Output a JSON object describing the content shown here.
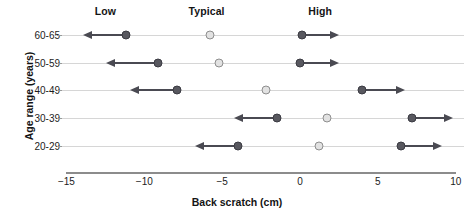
{
  "chart_data": {
    "type": "scatter",
    "title": "",
    "xlabel": "Back scratch (cm)",
    "ylabel": "Age range (years)",
    "xlim": [
      -15,
      10
    ],
    "xticks": [
      -15,
      -10,
      -5,
      0,
      5,
      10
    ],
    "xtick_labels": [
      "−15",
      "−10",
      "−5",
      "0",
      "5",
      "10"
    ],
    "categories": [
      "60-65",
      "50-59",
      "40-49",
      "30-39",
      "20-29"
    ],
    "grid": true,
    "legend": "none",
    "column_headers": [
      {
        "label": "Low",
        "x": -12.5
      },
      {
        "label": "Typical",
        "x": -6.0
      },
      {
        "label": "High",
        "x": 1.3
      }
    ],
    "series": [
      {
        "name": "Low",
        "marker": "filled",
        "values": [
          -11.2,
          -9.1,
          -7.9,
          -1.5,
          -4.0
        ]
      },
      {
        "name": "Typical",
        "marker": "open",
        "values": [
          -5.8,
          -5.2,
          -2.2,
          1.75,
          1.2
        ]
      },
      {
        "name": "High",
        "marker": "filled",
        "values": [
          0.1,
          0.0,
          4.0,
          7.2,
          6.5
        ]
      }
    ],
    "rows": [
      {
        "category": "60-65",
        "low": {
          "value": -11.2,
          "arrow_to": -13.8,
          "direction": "left"
        },
        "typical": {
          "value": -5.8
        },
        "high": {
          "value": 0.1,
          "arrow_to": 2.4,
          "direction": "right"
        }
      },
      {
        "category": "50-59",
        "low": {
          "value": -9.1,
          "arrow_to": -12.3,
          "direction": "left"
        },
        "typical": {
          "value": -5.2
        },
        "high": {
          "value": 0.0,
          "arrow_to": 2.4,
          "direction": "right"
        }
      },
      {
        "category": "40-49",
        "low": {
          "value": -7.9,
          "arrow_to": -10.8,
          "direction": "left"
        },
        "typical": {
          "value": -2.2
        },
        "high": {
          "value": 4.0,
          "arrow_to": 6.6,
          "direction": "right"
        }
      },
      {
        "category": "30-39",
        "low": {
          "value": -1.5,
          "arrow_to": -4.1,
          "direction": "left"
        },
        "typical": {
          "value": 1.75
        },
        "high": {
          "value": 7.2,
          "arrow_to": 9.7,
          "direction": "right"
        }
      },
      {
        "category": "20-29",
        "low": {
          "value": -4.0,
          "arrow_to": -6.6,
          "direction": "left"
        },
        "typical": {
          "value": 1.2
        },
        "high": {
          "value": 6.5,
          "arrow_to": 9.0,
          "direction": "right"
        }
      }
    ],
    "colors": {
      "marker_filled": "#58585f",
      "marker_open": "#e2e2e2",
      "marker_open_border": "#8e8e8e",
      "range_line": "#4a4a52",
      "gridline": "#d6d6d6",
      "axis": "#8c8c8c",
      "text": "#141414",
      "background": "#ffffff"
    }
  }
}
